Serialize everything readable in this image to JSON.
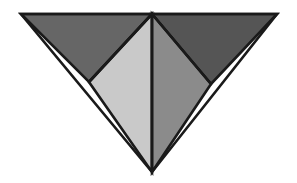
{
  "figure": {
    "title": "Inverted triangle subdivided into four shaded triangular facets",
    "background_color": "#ffffff",
    "canvas": {
      "width": 297,
      "height": 183
    },
    "outline_color": "#1a1a1a",
    "outline_width": 2.6,
    "vertices": {
      "top_left": [
        21,
        14
      ],
      "top_center": [
        152,
        14
      ],
      "top_right": [
        277,
        14
      ],
      "left_edge_mid": [
        89,
        82
      ],
      "right_edge_mid": [
        211,
        84
      ],
      "bottom_apex": [
        152,
        172
      ]
    },
    "facets": [
      {
        "name": "upper-left-facet",
        "label": "Upper left triangle",
        "color": "#666666",
        "points": "21,14 152,14 89,82"
      },
      {
        "name": "upper-right-facet",
        "label": "Upper right triangle",
        "color": "#555555",
        "points": "152,14 277,14 211,84"
      },
      {
        "name": "lower-left-facet",
        "label": "Lower left triangle",
        "color": "#c9c9c9",
        "points": "89,82 152,14 152,172"
      },
      {
        "name": "lower-right-facet",
        "label": "Lower right triangle",
        "color": "#8b8b8b",
        "points": "152,14 211,84 152,172"
      }
    ],
    "dividers": [
      {
        "name": "center-vertical-divider",
        "x1": 152,
        "y1": 14,
        "x2": 152,
        "y2": 172
      },
      {
        "name": "left-diagonal-divider",
        "x1": 152,
        "y1": 14,
        "x2": 89,
        "y2": 82
      },
      {
        "name": "right-diagonal-divider",
        "x1": 152,
        "y1": 14,
        "x2": 211,
        "y2": 84
      }
    ],
    "outer_outline": "21,14 277,14 152,172"
  }
}
